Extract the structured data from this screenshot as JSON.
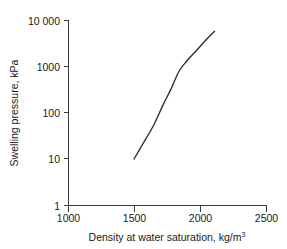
{
  "chart_data": {
    "type": "line",
    "title": "",
    "xlabel": "Density at water saturation, kg/m",
    "xlabel_sup": "3",
    "ylabel": "Swelling pressure, kPa",
    "xlim": [
      1000,
      2500
    ],
    "ylim": [
      1,
      10000
    ],
    "yscale": "log",
    "xscale": "linear",
    "grid": false,
    "legend": null,
    "xticks": [
      1000,
      1500,
      2000,
      2500
    ],
    "xtick_labels": [
      "1000",
      "1500",
      "2000",
      "2500"
    ],
    "yticks": [
      1,
      10,
      100,
      1000,
      10000
    ],
    "ytick_labels": [
      "1",
      "10",
      "100",
      "1000",
      "10 000"
    ],
    "series": [
      {
        "name": "Swelling pressure vs density",
        "x": [
          1500,
          1570,
          1650,
          1720,
          1780,
          1840,
          1900,
          1980,
          2050,
          2110
        ],
        "y": [
          10,
          22,
          55,
          150,
          330,
          800,
          1350,
          2400,
          4000,
          6000
        ]
      }
    ],
    "colors": {
      "curve": "#2b2b2b",
      "axis": "#3a3a3a",
      "text": "#1a1a1a",
      "background": "#ffffff"
    }
  },
  "axes_geometry": {
    "x_pixels": [
      68,
      134,
      200,
      266
    ],
    "y_pixels": [
      205,
      159,
      113,
      67,
      21
    ]
  }
}
